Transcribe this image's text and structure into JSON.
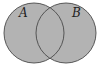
{
  "diagram": {
    "type": "venn",
    "shaded_region": "A ∪ B",
    "colors": {
      "fill": "#b3b3b3",
      "stroke": "#4a4a4a",
      "background": "#ffffff"
    },
    "sets": [
      {
        "label": "A",
        "cx": 34,
        "cy": 33,
        "r": 30
      },
      {
        "label": "B",
        "cx": 66,
        "cy": 33,
        "r": 30
      }
    ]
  }
}
